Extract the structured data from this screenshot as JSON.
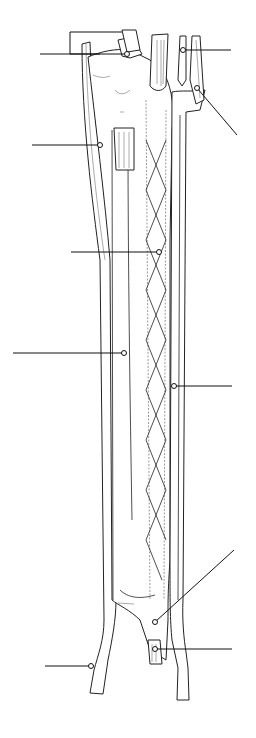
{
  "diagram": {
    "label_count": 10,
    "labels": [
      {
        "id": "L1",
        "side": "left",
        "text": "",
        "line_y": 54
      },
      {
        "id": "L2",
        "side": "left",
        "text": "",
        "line_y": 145
      },
      {
        "id": "L3",
        "side": "left",
        "text": "",
        "line_y": 252
      },
      {
        "id": "L4",
        "side": "left",
        "text": "",
        "line_y": 353
      },
      {
        "id": "L5",
        "side": "left",
        "text": "",
        "line_y": 666
      },
      {
        "id": "R1",
        "side": "right",
        "text": "",
        "line_y": 50
      },
      {
        "id": "R2",
        "side": "right",
        "text": "",
        "line_y": 88
      },
      {
        "id": "R3",
        "side": "right",
        "text": "",
        "line_y": 386
      },
      {
        "id": "R4",
        "side": "right",
        "text": "",
        "line_y": 590
      },
      {
        "id": "R5",
        "side": "right",
        "text": "",
        "line_y": 649
      }
    ],
    "colors": {
      "line": "#222222",
      "background": "#ffffff"
    }
  }
}
